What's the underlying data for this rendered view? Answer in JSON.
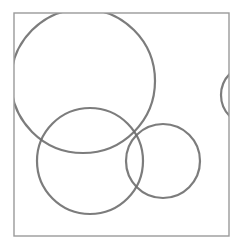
{
  "diagram": {
    "type": "circles-in-frame",
    "background": "#ffffff",
    "stroke_color": "#6e6e6e",
    "frame": {
      "x": 14,
      "y": 13,
      "width": 215,
      "height": 223,
      "stroke": "#9a9a9a",
      "stroke_width": 1.4
    },
    "circles": [
      {
        "id": "large-circle",
        "cx": 83,
        "cy": 81,
        "r": 72,
        "stroke_width": 2.2
      },
      {
        "id": "middle-circle",
        "cx": 90,
        "cy": 161,
        "r": 53,
        "stroke_width": 2.2
      },
      {
        "id": "small-circle",
        "cx": 163,
        "cy": 161,
        "r": 37,
        "stroke_width": 2.2
      },
      {
        "id": "right-edge-circle",
        "cx": 251,
        "cy": 95,
        "r": 30,
        "stroke_width": 2.2
      }
    ]
  }
}
